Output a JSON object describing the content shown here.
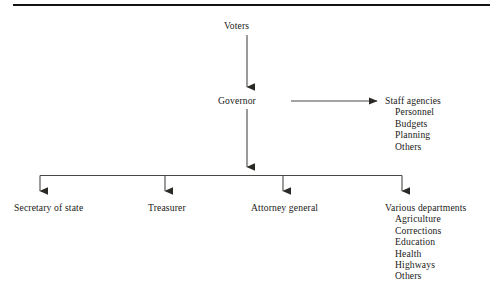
{
  "diagram": {
    "rule_color": "#141312",
    "line_color": "#4a4845",
    "text_color": "#1b1a18",
    "background": "#ffffff",
    "nodes": {
      "voters": {
        "label": "Voters"
      },
      "governor": {
        "label": "Governor"
      },
      "staff_agencies": {
        "label": "Staff agencies",
        "items": [
          "Personnel",
          "Budgets",
          "Planning",
          "Others"
        ]
      },
      "secretary_of_state": {
        "label": "Secretary of state"
      },
      "treasurer": {
        "label": "Treasurer"
      },
      "attorney_general": {
        "label": "Attorney general"
      },
      "various_departments": {
        "label": "Various departments",
        "items": [
          "Agriculture",
          "Corrections",
          "Education",
          "Health",
          "Highways",
          "Others"
        ]
      }
    },
    "connections": [
      {
        "from": "voters",
        "to": "governor",
        "style": "vertical-arrow"
      },
      {
        "from": "governor",
        "to": "staff_agencies",
        "style": "horizontal-arrow"
      },
      {
        "from": "governor",
        "to": "bus",
        "style": "vertical-arrow"
      },
      {
        "from": "bus",
        "to": "secretary_of_state",
        "style": "vertical-arrow"
      },
      {
        "from": "bus",
        "to": "treasurer",
        "style": "vertical-arrow"
      },
      {
        "from": "bus",
        "to": "attorney_general",
        "style": "vertical-arrow"
      },
      {
        "from": "bus",
        "to": "various_departments",
        "style": "vertical-arrow"
      }
    ]
  }
}
